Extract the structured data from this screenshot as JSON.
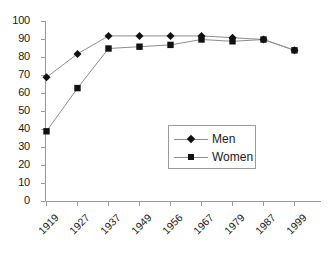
{
  "chart_data": {
    "type": "line",
    "title": "",
    "subtitle": "",
    "xlabel": "",
    "ylabel": "",
    "categories": [
      "1919",
      "1927",
      "1937",
      "1949",
      "1956",
      "1967",
      "1979",
      "1987",
      "1999"
    ],
    "series": [
      {
        "name": "Men",
        "marker": "diamond",
        "values": [
          69,
          82,
          92,
          92,
          92,
          92,
          91,
          90,
          84
        ]
      },
      {
        "name": "Women",
        "marker": "square",
        "values": [
          39,
          63,
          85,
          86,
          87,
          90,
          89,
          90,
          84
        ]
      }
    ],
    "ylim": [
      0,
      100
    ],
    "ytick_step": 10,
    "yticks": [
      "0",
      "10",
      "20",
      "30",
      "40",
      "50",
      "60",
      "70",
      "80",
      "90",
      "100"
    ],
    "grid": false,
    "legend_position": "inside-lower-right",
    "colors": {
      "line": "#8d8d8d",
      "marker": "#111111",
      "axis": "#9a9a9a",
      "text": "#1a1a1a",
      "legend_border": "#9a9a9a",
      "background": "#ffffff"
    }
  },
  "legend": {
    "entries": [
      {
        "label": "Men"
      },
      {
        "label": "Women"
      }
    ]
  }
}
